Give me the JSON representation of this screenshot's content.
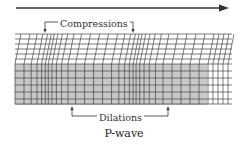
{
  "diagram": {
    "title": "P-wave",
    "labels": {
      "compressions": "Compressions",
      "dilations": "Dilations"
    },
    "propagation_arrow": {
      "direction": "right"
    },
    "colors": {
      "line": "#333333",
      "shade": "#c8c8c8",
      "background": "#ffffff"
    },
    "compression_zones_x": [
      45,
      133
    ],
    "dilation_zones_x": [
      72,
      168
    ]
  }
}
